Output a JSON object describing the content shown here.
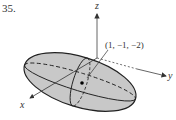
{
  "problem_number": "35.",
  "axes": {
    "x_label": "x",
    "y_label": "y",
    "z_label": "z"
  },
  "point_label": "(1, −1, −2)",
  "colors": {
    "fill": "#c8c8c8",
    "stroke": "#222222",
    "axis": "#444444",
    "background": "#ffffff"
  },
  "figure": {
    "shape": "ellipsoid",
    "center": [
      1,
      -1,
      -2
    ]
  }
}
